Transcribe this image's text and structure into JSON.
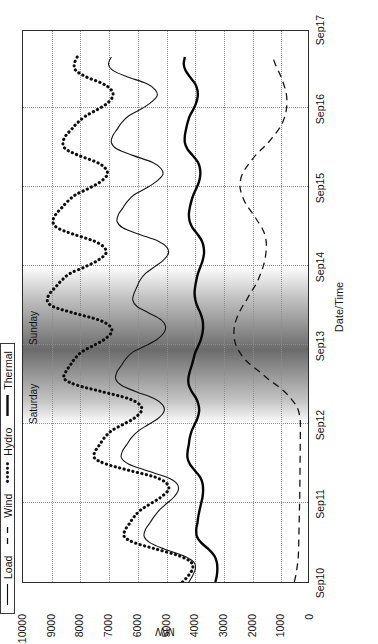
{
  "figure": {
    "orientation": "rotated-90-ccw",
    "background": "#ffffff"
  },
  "legend": {
    "position": "top-left",
    "items": [
      {
        "label": "Load",
        "style": "solid-thin",
        "key": "load-line-key"
      },
      {
        "label": "Wind",
        "style": "dashed",
        "key": "wind-line-key"
      },
      {
        "label": "Hydro",
        "style": "dotted-thick",
        "key": "hydro-line-key"
      },
      {
        "label": "Thermal",
        "style": "solid-thick",
        "key": "thermal-line-key"
      }
    ]
  },
  "annotations": [
    {
      "label": "Saturday",
      "x": 2.28
    },
    {
      "label": "Sunday",
      "x": 3.28
    }
  ],
  "colors": {
    "axis": "#2b2b2b",
    "grid": "#8d8d8d",
    "series": "#0d0d0d",
    "weekend_shade": "#4a4a4a"
  },
  "chart_data": {
    "type": "line",
    "title": "",
    "xlabel": "Date/Time",
    "ylabel": "MW",
    "xlim": [
      0,
      7
    ],
    "ylim": [
      0,
      10000
    ],
    "grid": true,
    "legend_position": "top-left",
    "xtick_labels": [
      "Sep10",
      "Sep11",
      "Sep12",
      "Sep13",
      "Sep14",
      "Sep15",
      "Sep16",
      "Sep17"
    ],
    "xtick_values": [
      0,
      1,
      2,
      3,
      4,
      5,
      6,
      7
    ],
    "ytick_labels": [
      "0",
      "1000",
      "2000",
      "3000",
      "4000",
      "5000",
      "6000",
      "7000",
      "8000",
      "9000",
      "10000"
    ],
    "ytick_values": [
      0,
      1000,
      2000,
      3000,
      4000,
      5000,
      6000,
      7000,
      8000,
      9000,
      10000
    ],
    "shaded_regions": [
      {
        "label": "weekend",
        "x_start": 2.0,
        "x_end": 4.0,
        "style": "gradient-gray"
      }
    ],
    "x": [
      0,
      0.08,
      0.17,
      0.25,
      0.33,
      0.42,
      0.5,
      0.58,
      0.67,
      0.75,
      0.83,
      0.92,
      1,
      1.08,
      1.17,
      1.25,
      1.33,
      1.42,
      1.5,
      1.58,
      1.67,
      1.75,
      1.83,
      1.92,
      2,
      2.08,
      2.17,
      2.25,
      2.33,
      2.42,
      2.5,
      2.58,
      2.67,
      2.75,
      2.83,
      2.92,
      3,
      3.08,
      3.17,
      3.25,
      3.33,
      3.42,
      3.5,
      3.58,
      3.67,
      3.75,
      3.83,
      3.92,
      4,
      4.08,
      4.17,
      4.25,
      4.33,
      4.42,
      4.5,
      4.58,
      4.67,
      4.75,
      4.83,
      4.92,
      5,
      5.08,
      5.17,
      5.25,
      5.33,
      5.42,
      5.5,
      5.58,
      5.67,
      5.75,
      5.83,
      5.92,
      6,
      6.08,
      6.17,
      6.25,
      6.33,
      6.42,
      6.5,
      6.58,
      6.67
    ],
    "series": [
      {
        "name": "Load",
        "style": "solid-thin",
        "values": [
          4180,
          4050,
          3950,
          4000,
          4350,
          5050,
          5550,
          5750,
          5700,
          5550,
          5400,
          5200,
          4950,
          4700,
          4550,
          4600,
          4950,
          5700,
          6300,
          6550,
          6500,
          6350,
          6200,
          5950,
          5600,
          5250,
          5050,
          5100,
          5400,
          6050,
          6550,
          6750,
          6700,
          6550,
          6400,
          6150,
          5700,
          5300,
          5050,
          5000,
          5150,
          5600,
          6000,
          6150,
          6100,
          6000,
          5900,
          5700,
          5400,
          5100,
          4900,
          4950,
          5250,
          5950,
          6500,
          6700,
          6650,
          6500,
          6350,
          6100,
          5700,
          5350,
          5100,
          5150,
          5450,
          6150,
          6700,
          6900,
          6850,
          6700,
          6550,
          6300,
          5900,
          5550,
          5300,
          5350,
          5650,
          6350,
          6850,
          7000,
          6900
        ]
      },
      {
        "name": "Wind",
        "style": "dashed",
        "values": [
          480,
          430,
          390,
          360,
          340,
          330,
          325,
          320,
          315,
          310,
          305,
          300,
          295,
          290,
          288,
          285,
          283,
          280,
          278,
          276,
          274,
          272,
          270,
          268,
          266,
          280,
          330,
          430,
          600,
          830,
          1100,
          1400,
          1700,
          1980,
          2220,
          2400,
          2520,
          2580,
          2600,
          2580,
          2520,
          2420,
          2300,
          2160,
          2020,
          1880,
          1760,
          1660,
          1580,
          1520,
          1480,
          1460,
          1470,
          1520,
          1620,
          1760,
          1920,
          2080,
          2220,
          2320,
          2380,
          2380,
          2320,
          2200,
          2040,
          1840,
          1620,
          1400,
          1200,
          1030,
          900,
          810,
          760,
          740,
          750,
          790,
          860,
          950,
          1050,
          1150,
          1240
        ]
      },
      {
        "name": "Hydro",
        "style": "dotted-thick",
        "values": [
          4400,
          4200,
          4050,
          4100,
          4500,
          5350,
          6100,
          6450,
          6400,
          6250,
          6100,
          5850,
          5500,
          5150,
          4900,
          4950,
          5350,
          6300,
          7100,
          7500,
          7450,
          7300,
          7150,
          6900,
          6500,
          6100,
          5850,
          5900,
          6300,
          7250,
          8100,
          8550,
          8500,
          8350,
          8200,
          7950,
          7550,
          7150,
          6900,
          6950,
          7350,
          8250,
          8950,
          9150,
          9050,
          8850,
          8650,
          8350,
          7850,
          7400,
          7100,
          7150,
          7500,
          8250,
          8800,
          8950,
          8850,
          8650,
          8450,
          8150,
          7700,
          7300,
          7050,
          7100,
          7400,
          8050,
          8500,
          8600,
          8500,
          8300,
          8100,
          7800,
          7400,
          7050,
          6850,
          6900,
          7200,
          7800,
          8150,
          8200,
          8100
        ]
      },
      {
        "name": "Thermal",
        "style": "solid-thick",
        "values": [
          3250,
          3200,
          3180,
          3200,
          3280,
          3500,
          3750,
          3900,
          3920,
          3880,
          3850,
          3800,
          3750,
          3700,
          3680,
          3700,
          3780,
          3980,
          4150,
          4230,
          4220,
          4180,
          4150,
          4080,
          3980,
          3880,
          3820,
          3840,
          3920,
          4080,
          4180,
          4200,
          4150,
          4080,
          4020,
          3950,
          3850,
          3760,
          3700,
          3680,
          3700,
          3780,
          3880,
          3950,
          3980,
          3960,
          3920,
          3860,
          3780,
          3700,
          3650,
          3660,
          3720,
          3880,
          4050,
          4150,
          4180,
          4150,
          4100,
          4020,
          3920,
          3830,
          3780,
          3790,
          3860,
          4050,
          4230,
          4320,
          4320,
          4280,
          4230,
          4150,
          4030,
          3930,
          3870,
          3880,
          3960,
          4150,
          4300,
          4360,
          4320
        ]
      }
    ]
  }
}
